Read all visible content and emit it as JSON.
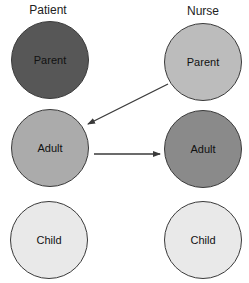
{
  "diagram": {
    "columns": [
      {
        "label": "Patient"
      },
      {
        "label": "Nurse"
      }
    ],
    "patient": {
      "parent": {
        "label": "Parent",
        "color": "#575757"
      },
      "adult": {
        "label": "Adult",
        "color": "#ababab"
      },
      "child": {
        "label": "Child",
        "color": "#e9e9e9"
      }
    },
    "nurse": {
      "parent": {
        "label": "Parent",
        "color": "#bcbcbc"
      },
      "adult": {
        "label": "Adult",
        "color": "#8a8a8a"
      },
      "child": {
        "label": "Child",
        "color": "#e9e9e9"
      }
    },
    "arrows": [
      {
        "from": "Nurse Parent",
        "to": "Patient Adult"
      },
      {
        "from": "Patient Adult",
        "to": "Nurse Adult"
      }
    ],
    "stroke_color": "#3a3a3a"
  }
}
